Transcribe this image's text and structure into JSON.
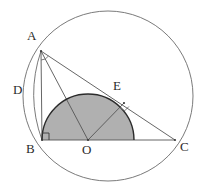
{
  "figure": {
    "background_color": "#ffffff",
    "stroke_color": "#555555",
    "label_color": "#2b2b2b",
    "shaded_fill_color": "#b0b0b0",
    "semicircle_stroke_color": "#2b2b2b"
  },
  "points": [
    {
      "id": "A",
      "label": "A",
      "x": 41,
      "y": 51,
      "label_x": 27,
      "label_y": 29
    },
    {
      "id": "B",
      "label": "B",
      "x": 42,
      "y": 140,
      "label_x": 26,
      "label_y": 142
    },
    {
      "id": "C",
      "label": "C",
      "x": 175,
      "y": 140,
      "label_x": 180,
      "label_y": 140
    },
    {
      "id": "D",
      "label": "D",
      "x": 35,
      "y": 98,
      "label_x": 13,
      "label_y": 83
    },
    {
      "id": "E",
      "label": "E",
      "x": 124,
      "y": 103,
      "label_x": 113,
      "label_y": 79
    },
    {
      "id": "O",
      "label": "O",
      "x": 88,
      "y": 140,
      "label_x": 82,
      "label_y": 143
    }
  ],
  "shapes": {
    "big_circle": {
      "name": "circumcircle",
      "cx": 108,
      "cy": 96,
      "r": 85
    },
    "semicircle": {
      "name": "shaded-semicircle",
      "cx": 88,
      "cy": 140,
      "r": 46
    },
    "arc_ADB": {
      "name": "tangent-arc-A-D-B",
      "from_x": 41,
      "from_y": 51,
      "to_x": 42,
      "to_y": 140,
      "rx": 134,
      "ry": 134
    }
  },
  "segments": [
    {
      "name": "segment-AB",
      "from": "A",
      "to": "B"
    },
    {
      "name": "segment-AC",
      "from": "A",
      "to": "C"
    },
    {
      "name": "segment-BC",
      "from": "B",
      "to": "C"
    },
    {
      "name": "segment-AO",
      "from": "A",
      "to": "O"
    },
    {
      "name": "segment-OE",
      "from": "O",
      "to": "E"
    }
  ],
  "angle_marks": [
    {
      "name": "right-angle-at-B",
      "type": "right-angle",
      "at": "B"
    },
    {
      "name": "angle-arc-at-A",
      "type": "arc",
      "at": "A"
    },
    {
      "name": "right-angle-at-E",
      "type": "right-angle",
      "at": "E"
    }
  ]
}
